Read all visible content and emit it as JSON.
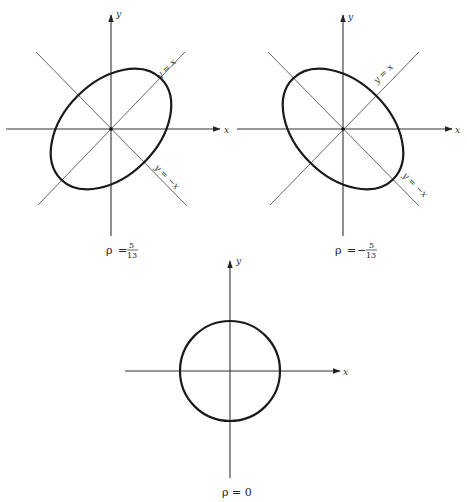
{
  "figure": {
    "panels": [
      {
        "id": "positive-correlation",
        "axis_x_label": "x",
        "axis_y_label": "y",
        "line_label_pos": "y = x",
        "line_label_neg": "y = −x",
        "rho_symbol": "ρ",
        "rho_equals": "=",
        "rho_sign": "",
        "rho_num": "5",
        "rho_den": "13",
        "shape": "ellipse",
        "major_axis": "y = x"
      },
      {
        "id": "negative-correlation",
        "axis_x_label": "x",
        "axis_y_label": "y",
        "line_label_pos": "y = x",
        "line_label_neg": "y = −x",
        "rho_symbol": "ρ",
        "rho_equals": "=",
        "rho_sign": "−",
        "rho_num": "5",
        "rho_den": "13",
        "shape": "ellipse",
        "major_axis": "y = −x"
      },
      {
        "id": "zero-correlation",
        "axis_x_label": "x",
        "axis_y_label": "y",
        "rho_label": "ρ = 0",
        "shape": "circle"
      }
    ],
    "colors": {
      "curve": "#1a1a1a",
      "axis": "#333333",
      "diagonal": "#555555",
      "background": "#ffffff"
    }
  }
}
